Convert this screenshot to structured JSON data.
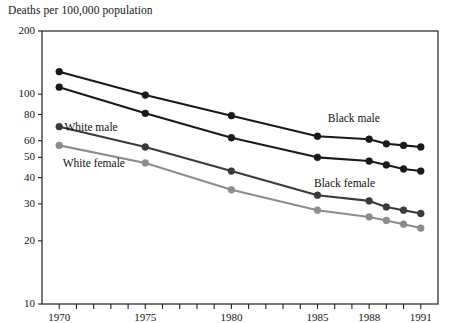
{
  "chart_data": {
    "type": "line",
    "title": "Deaths per 100,000 population",
    "xlabel": "",
    "ylabel": "Deaths per 100,000 population",
    "yscale": "log",
    "ylim": [
      10,
      200
    ],
    "xlim": [
      1969,
      1992
    ],
    "grid": false,
    "legend_position": "inline-annotations",
    "ytick_labels": [
      "200",
      "100",
      "80",
      "60",
      "50",
      "40",
      "30",
      "20",
      "10"
    ],
    "ytick_values": [
      200,
      100,
      80,
      60,
      50,
      40,
      30,
      20,
      10
    ],
    "xtick_labels": [
      "1970",
      "1975",
      "1980",
      "1985",
      "1988",
      "1991"
    ],
    "xtick_values": [
      1970,
      1975,
      1980,
      1985,
      1988,
      1991
    ],
    "x": [
      1970,
      1975,
      1980,
      1985,
      1988,
      1989,
      1990,
      1991
    ],
    "series": [
      {
        "name": "Black male",
        "color": "#1a1a1a",
        "label_x": 1985.6,
        "label_y": 75,
        "values": [
          128,
          99,
          79,
          63,
          61,
          58,
          57,
          56
        ]
      },
      {
        "name": "White male",
        "color": "#1a1a1a",
        "label_x": 1970.3,
        "label_y": 68,
        "values": [
          108,
          81,
          62,
          50,
          48,
          46,
          44,
          43
        ]
      },
      {
        "name": "Black female",
        "color": "#3a3a3a",
        "label_x": 1984.8,
        "label_y": 37,
        "values": [
          70,
          56,
          43,
          33,
          31,
          29,
          28,
          27
        ]
      },
      {
        "name": "White female",
        "color": "#8c8c8c",
        "label_x": 1970.2,
        "label_y": 46,
        "values": [
          57,
          47,
          35,
          28,
          26,
          25,
          24,
          23
        ]
      }
    ]
  }
}
